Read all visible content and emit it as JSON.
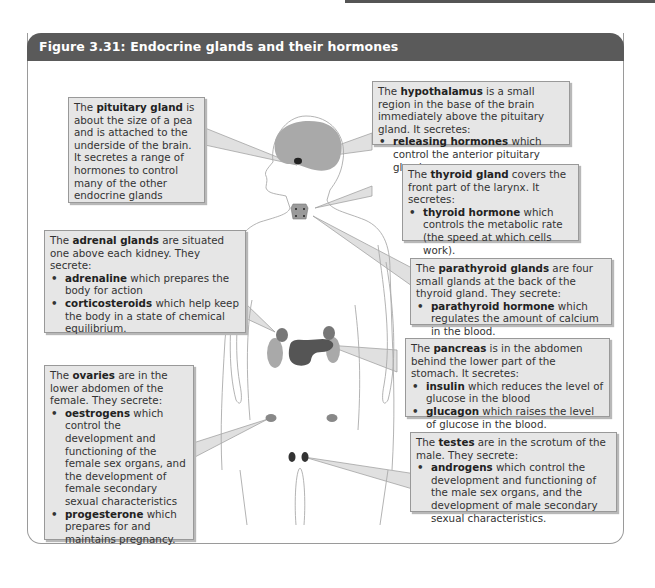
{
  "figure": {
    "title": "Figure 3.31: Endocrine glands and their hormones"
  },
  "colors": {
    "title_bar": "#5a5a5a",
    "callout_bg": "#e6e6e6",
    "brain": "#a9a9a9",
    "pancreas": "#555555",
    "adrenal_kidney": "#8c8c8c"
  },
  "callouts": {
    "pituitary": {
      "pre": "The ",
      "term": "pituitary gland",
      "post": " is about the size of a pea and is attached to the underside of the brain. It secretes a range of hormones to control many of the other endocrine glands",
      "items": []
    },
    "hypothalamus": {
      "pre": "The ",
      "term": "hypothalamus",
      "post": " is a small region in the base of the brain immediately above the pituitary gland. It secretes:",
      "items": [
        {
          "term": "releasing hormones",
          "text": " which control the anterior pituitary gland."
        }
      ]
    },
    "thyroid": {
      "pre": "The ",
      "term": "thyroid gland",
      "post": " covers the front part of the larynx. It secretes:",
      "items": [
        {
          "term": "thyroid hormone",
          "text": " which controls the metabolic rate (the speed at which cells work)."
        }
      ]
    },
    "parathyroid": {
      "pre": "The ",
      "term": "parathyroid glands",
      "post": " are four small glands at the back of the thyroid gland. They secrete:",
      "items": [
        {
          "term": "parathyroid hormone",
          "text": " which regulates the amount of calcium in the blood."
        }
      ]
    },
    "adrenal": {
      "pre": "The ",
      "term": "adrenal glands",
      "post": " are situated one above each kidney. They secrete:",
      "items": [
        {
          "term": "adrenaline",
          "text": " which prepares the body for action"
        },
        {
          "term": "corticosteroids",
          "text": " which help keep the body in a state of chemical equilibrium."
        }
      ]
    },
    "pancreas": {
      "pre": "The ",
      "term": "pancreas",
      "post": " is in the abdomen behind the lower part of the stomach. It secretes:",
      "items": [
        {
          "term": "insulin",
          "text": " which reduces the level of glucose in the blood"
        },
        {
          "term": "glucagon",
          "text": " which raises the level of glucose in the blood."
        }
      ]
    },
    "ovaries": {
      "pre": "The ",
      "term": "ovaries",
      "post": " are in the lower abdomen of the female. They secrete:",
      "items": [
        {
          "term": "oestrogens",
          "text": " which control the development and functioning of the female sex organs, and the development of female secondary sexual characteristics"
        },
        {
          "term": "progesterone",
          "text": " which prepares for and maintains pregnancy."
        }
      ]
    },
    "testes": {
      "pre": "The ",
      "term": "testes",
      "post": " are in the scrotum of the male. They secrete:",
      "items": [
        {
          "term": "androgens",
          "text": " which control the development and functioning of the male sex organs, and the development of male secondary sexual characteristics."
        }
      ]
    }
  }
}
